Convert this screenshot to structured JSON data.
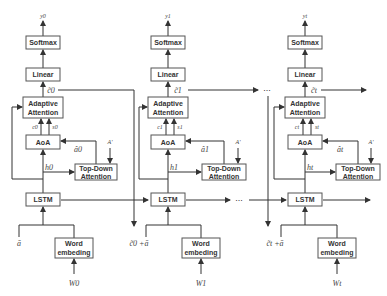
{
  "diagram": {
    "type": "attention-decoder-unrolled",
    "columns": [
      {
        "output": "y0",
        "softmax": "Softmax",
        "linear": "Linear",
        "context_out": "c̃0",
        "adaptive_attention": [
          "Adaptive",
          "Attention"
        ],
        "c_label": "c0",
        "s_label": "s0",
        "aoa": "AoA",
        "a_hat": "â0",
        "a_prime": "A'",
        "h_label": "h0",
        "top_down": [
          "Top-Down",
          "Attention"
        ],
        "lstm": "LSTM",
        "input_left": "ā",
        "word_embed": [
          "Word",
          "embeding"
        ],
        "word_input": "W0"
      },
      {
        "output": "y1",
        "softmax": "Softmax",
        "linear": "Linear",
        "context_out": "c̃1",
        "adaptive_attention": [
          "Adaptive",
          "Attention"
        ],
        "c_label": "c1",
        "s_label": "s1",
        "aoa": "AoA",
        "a_hat": "â1",
        "a_prime": "A'",
        "h_label": "h1",
        "top_down": [
          "Top-Down",
          "Attention"
        ],
        "lstm": "LSTM",
        "input_left": "c̃0 +ā",
        "word_embed": [
          "Word",
          "embeding"
        ],
        "word_input": "W1"
      },
      {
        "output": "yt",
        "softmax": "Softmax",
        "linear": "Linear",
        "context_out": "c̃t",
        "adaptive_attention": [
          "Adaptive",
          "Attention"
        ],
        "c_label": "ct",
        "s_label": "st",
        "aoa": "AoA",
        "a_hat": "ât",
        "a_prime": "A'",
        "h_label": "ht",
        "top_down": [
          "Top-Down",
          "Attention"
        ],
        "lstm": "LSTM",
        "input_left": "c̃t +ā",
        "word_embed": [
          "Word",
          "embeding"
        ],
        "word_input": "Wt"
      }
    ],
    "ellipsis": "..."
  }
}
